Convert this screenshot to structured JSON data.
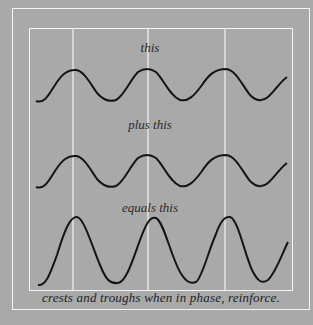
{
  "labels": {
    "wave1": "this",
    "wave2": "plus this",
    "wave3": "equals this",
    "caption": "crests and troughs when in phase, reinforce."
  },
  "colors": {
    "background": "#a9a9a9",
    "lines": "#f4f4f4",
    "wave": "#151515"
  }
}
